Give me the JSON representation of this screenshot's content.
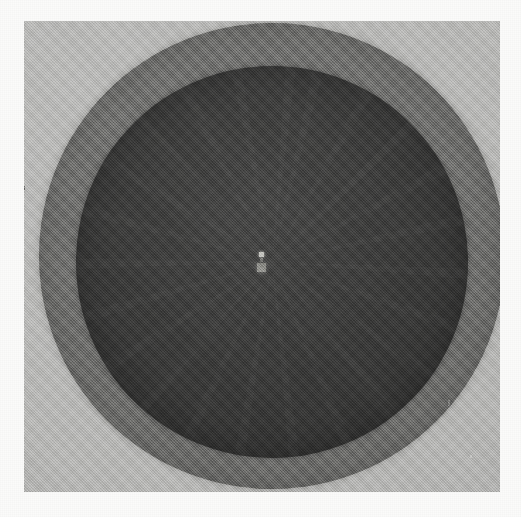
{
  "image": {
    "kind": "scanned-grayscale-radiograph",
    "caption": "Scanned grayscale radiograph of a circular phantom showing a concentric dark inner disc within a lighter annulus, with a small bright marker near the centre.",
    "width_px": 521,
    "height_px": 517,
    "has_visible_text": false,
    "has_visible_ui_controls": false
  },
  "page_margin": {
    "label": "paper-margin",
    "color": "#fbfbfa"
  },
  "scan_field": {
    "label": "scan-field",
    "color": "#b4b4b2",
    "left_px": 24,
    "top_px": 21,
    "width_px": 476,
    "height_px": 471
  },
  "outer_disc": {
    "label": "outer-annulus",
    "color": "#6d6d6b",
    "center_x_px": 272,
    "center_y_px": 256,
    "diameter_px": 466
  },
  "inner_disc": {
    "label": "inner-core-disc",
    "color": "#343433",
    "center_x_px": 272,
    "center_y_px": 262,
    "diameter_px": 392
  },
  "center_marker": {
    "label": "central-marker",
    "primary_color": "#b9b9b3",
    "secondary_color": "#8d8d88",
    "center_x_px": 262,
    "center_y_px": 262
  },
  "artifacts": {
    "grain": "film-grain-noise",
    "specks": [
      {
        "name": "dust-speck-left",
        "x_px": 22,
        "y_px": 186
      },
      {
        "name": "scratch-right",
        "x_px": 448,
        "y_px": 400
      },
      {
        "name": "scratch-corner",
        "x_px": 470,
        "y_px": 455
      }
    ]
  },
  "chart_data": {
    "type": "heatmap",
    "title": "",
    "xlabel": "",
    "ylabel": "",
    "radial_profile": {
      "radius_px": [
        0,
        60,
        120,
        180,
        196,
        210,
        225,
        233,
        240,
        250
      ],
      "gray_level": [
        52,
        52,
        52,
        52,
        53,
        109,
        109,
        109,
        140,
        180
      ]
    },
    "regions": [
      {
        "name": "inner-core-disc",
        "gray_level": 52,
        "hex": "#343433",
        "radius_px": 196
      },
      {
        "name": "outer-annulus",
        "gray_level": 109,
        "hex": "#6d6d6b",
        "radius_px": 233
      },
      {
        "name": "background-field",
        "gray_level": 180,
        "hex": "#b4b4b2",
        "radius_px": 250
      },
      {
        "name": "paper-margin",
        "gray_level": 251,
        "hex": "#fbfbfa",
        "radius_px": 0
      }
    ],
    "grid": false,
    "legend": "none"
  }
}
